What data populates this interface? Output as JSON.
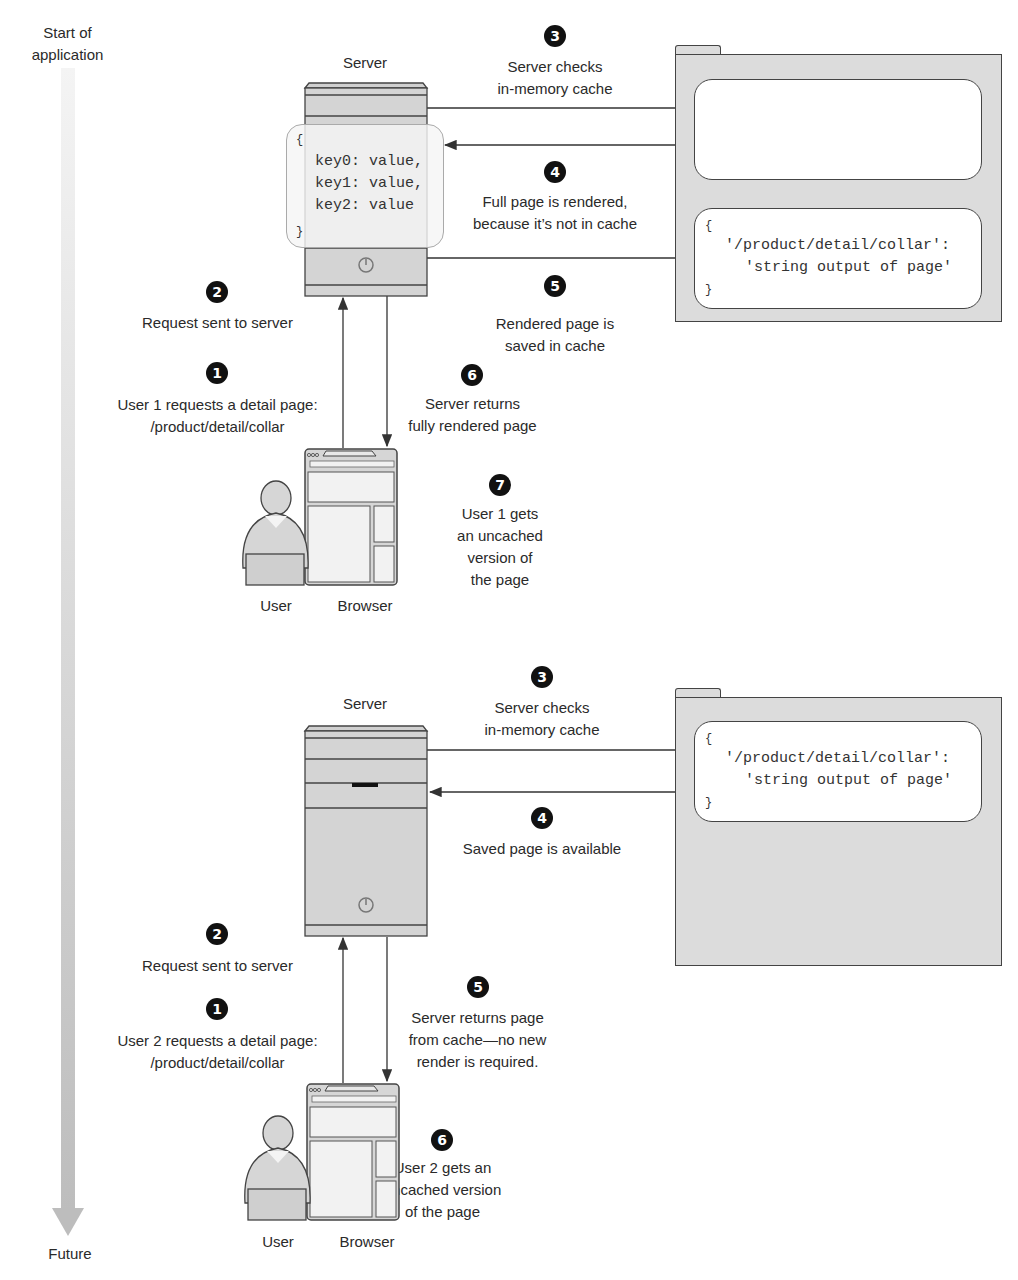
{
  "timeline": {
    "start_label_line1": "Start of",
    "start_label_line2": "application",
    "end_label": "Future",
    "arrow_color": "#c8c8c8"
  },
  "scenario1": {
    "server_label": "Server",
    "server_memory": {
      "open": "{",
      "lines": [
        "key0: value,",
        "key1: value,",
        "key2: value"
      ],
      "close": "}"
    },
    "steps": [
      {
        "num": "1",
        "line1": "User 1 requests a detail page:",
        "line2": "/product/detail/collar"
      },
      {
        "num": "2",
        "line1": "Request sent to server"
      },
      {
        "num": "3",
        "line1": "Server checks",
        "line2": "in-memory cache"
      },
      {
        "num": "4",
        "line1": "Full page is rendered,",
        "line2": "because it’s not in cache"
      },
      {
        "num": "5",
        "line1": "Rendered page is",
        "line2": "saved in cache"
      },
      {
        "num": "6",
        "line1": "Server returns",
        "line2": "fully rendered page"
      },
      {
        "num": "7",
        "line1": "User 1 gets",
        "line2": "an uncached",
        "line3": "version of",
        "line4": "the page"
      }
    ],
    "cache_entry": {
      "open": "{",
      "key": "'/product/detail/collar':",
      "value": "'string output of page'",
      "close": "}"
    },
    "user_label": "User",
    "browser_label": "Browser"
  },
  "scenario2": {
    "server_label": "Server",
    "steps": [
      {
        "num": "1",
        "line1": "User 2 requests a detail page:",
        "line2": "/product/detail/collar"
      },
      {
        "num": "2",
        "line1": "Request sent to server"
      },
      {
        "num": "3",
        "line1": "Server checks",
        "line2": "in-memory cache"
      },
      {
        "num": "4",
        "line1": "Saved page is available"
      },
      {
        "num": "5",
        "line1": "Server returns page",
        "line2": "from cache—no new",
        "line3": "render is required."
      },
      {
        "num": "6",
        "line1": "User 2 gets an",
        "line2": "uncached version",
        "line3": "of the page"
      }
    ],
    "cache_entry": {
      "open": "{",
      "key": "'/product/detail/collar':",
      "value": "'string output of page'",
      "close": "}"
    },
    "user_label": "User",
    "browser_label": "Browser"
  },
  "colors": {
    "server_fill": "#d4d4d4",
    "folder_fill": "#dcdcdc",
    "stroke": "#444444",
    "badge": "#111111"
  }
}
